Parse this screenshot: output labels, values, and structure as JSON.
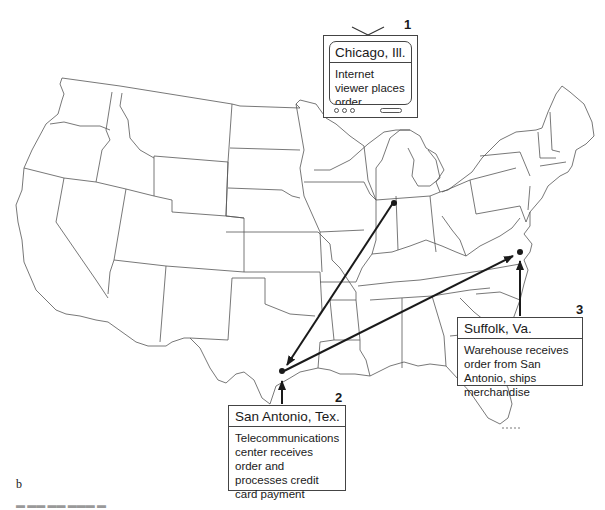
{
  "figure": {
    "panel_label": "b",
    "caption_fragment": "Fig. 16.3  b  ...  (cut off)",
    "map": "Outline map of the contiguous United States with state borders"
  },
  "steps": [
    {
      "number": "1",
      "location": "Chicago, Ill.",
      "description": "Internet viewer places order",
      "container": "television-set"
    },
    {
      "number": "2",
      "location": "San Antonio, Tex.",
      "description": "Telecommunications center receives order and processes credit card payment",
      "container": "box"
    },
    {
      "number": "3",
      "location": "Suffolk, Va.",
      "description": "Warehouse receives order from San Antonio, ships merchandise",
      "container": "box"
    }
  ],
  "flows": [
    {
      "from": "Chicago, Ill.",
      "to": "San Antonio, Tex."
    },
    {
      "from": "San Antonio, Tex.",
      "to": "Suffolk, Va."
    }
  ],
  "colors": {
    "line": "#1a1a1a",
    "border": "#444444",
    "background": "#ffffff"
  }
}
